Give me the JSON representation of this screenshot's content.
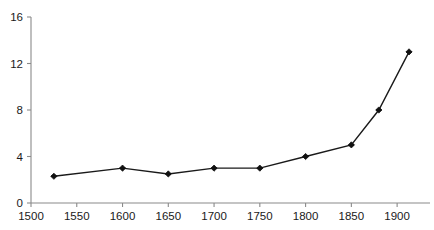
{
  "chart_data": {
    "type": "line",
    "title": "",
    "subtitle": "",
    "xlabel": "",
    "ylabel": "",
    "x": [
      1525,
      1600,
      1650,
      1700,
      1750,
      1800,
      1850,
      1880,
      1913
    ],
    "values": [
      2.3,
      3.0,
      2.5,
      3.0,
      3.0,
      4.0,
      5.0,
      8.0,
      13.0
    ],
    "series": [
      {
        "name": "",
        "x": [
          1525,
          1600,
          1650,
          1700,
          1750,
          1800,
          1850,
          1880,
          1913
        ],
        "values": [
          2.3,
          3.0,
          2.5,
          3.0,
          3.0,
          4.0,
          5.0,
          8.0,
          13.0
        ]
      }
    ],
    "xlim": [
      1500,
      1925
    ],
    "ylim": [
      0,
      16
    ],
    "xticks": [
      1500,
      1550,
      1600,
      1650,
      1700,
      1750,
      1800,
      1850,
      1900
    ],
    "yticks": [
      0,
      4,
      8,
      12,
      16
    ],
    "xtick_labels": [
      "1500",
      "1550",
      "1600",
      "1650",
      "1700",
      "1750",
      "1800",
      "1850",
      "1900"
    ],
    "ytick_labels": [
      "0",
      "4",
      "8",
      "12",
      "16"
    ],
    "grid": false,
    "legend": false,
    "legend_position": "none",
    "annotations": [],
    "marker": "diamond",
    "colors": {
      "line": "#1a1a1a",
      "marker": "#111111",
      "axis": "#8a8a8a",
      "tick_label": "#1a1a1a",
      "background": "#ffffff"
    }
  }
}
